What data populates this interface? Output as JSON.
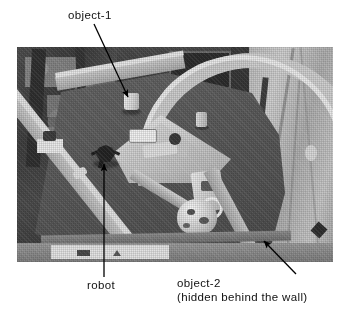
{
  "figure": {
    "name": "annotated-robot-arena-photograph",
    "background_color": "#ffffff",
    "photo": {
      "description": "Overhead photograph of an enclosed robot arena with light-gray walls and a dark-gray floor",
      "border_color": "#6e6e6e",
      "floor_color": "#5c5c5c",
      "wall_color": "#cfcfcf"
    }
  },
  "annotations": {
    "object_1": {
      "label": "object-1",
      "arrow": "diagonal-down-right",
      "target": "white cup on arena floor"
    },
    "robot": {
      "label": "robot",
      "arrow": "vertical-up",
      "target": "small dark robot on arena floor"
    },
    "object_2": {
      "label": "object-2",
      "sublabel": "(hidden behind the wall)",
      "arrow": "diagonal-up-left",
      "target": "object occluded by the lower-right wall"
    }
  },
  "style": {
    "text_color": "#111111",
    "arrow_color": "#000000"
  }
}
